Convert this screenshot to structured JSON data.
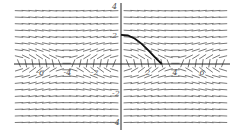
{
  "chart_data": {
    "type": "slope_field",
    "title": "",
    "xlabel": "",
    "ylabel": "",
    "xlim": [
      -8,
      8.5
    ],
    "ylim": [
      -4.3,
      4.3
    ],
    "x_ticks": [
      -6,
      -4,
      -2,
      2,
      4,
      6
    ],
    "y_ticks": [
      4,
      2,
      -2,
      -4
    ],
    "x_tick_labels": [
      "-6",
      "-4",
      "-2",
      "2",
      "4",
      "6"
    ],
    "y_tick_labels": [
      "4",
      "2",
      "-2",
      "-4"
    ],
    "grid": false,
    "legend": null,
    "field": {
      "description": "Slope field with short line segments; near-horizontal segments away from the x-axis, steep near-vertical segments close to y=0, with spiral/circular patterns centered near x = -6, -2, 2, 6 on the x-axis",
      "x_step": 0.5,
      "y_step": 0.5
    },
    "solution_curve": {
      "description": "Bold solution curve from (0, 2) descending to the x-axis near x ≈ 3",
      "points": [
        [
          0,
          2
        ],
        [
          0.5,
          1.95
        ],
        [
          1,
          1.75
        ],
        [
          1.5,
          1.4
        ],
        [
          2,
          0.95
        ],
        [
          2.5,
          0.45
        ],
        [
          3,
          0
        ]
      ]
    },
    "colors": {
      "axis": "#222222",
      "segments": "#6b6b6b",
      "curve": "#111111",
      "tick_text": "#555555"
    }
  }
}
